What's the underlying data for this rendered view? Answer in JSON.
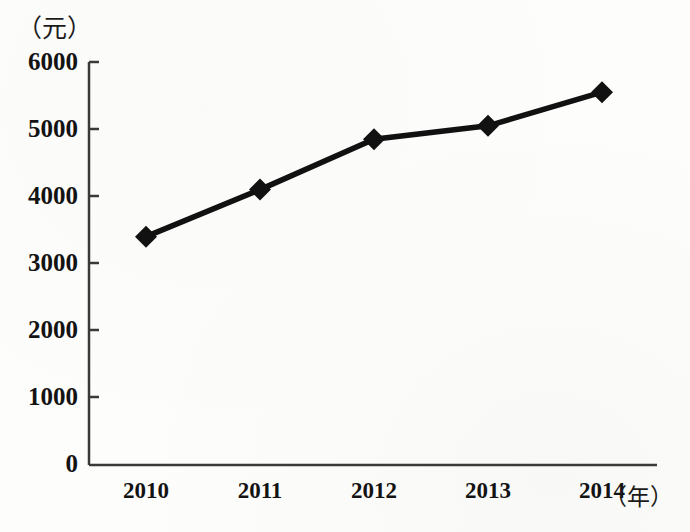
{
  "chart_data": {
    "type": "line",
    "title": "",
    "xlabel": "年",
    "ylabel": "元",
    "xlabel_display": "（年）",
    "ylabel_display": "（元）",
    "categories": [
      "2010",
      "2011",
      "2012",
      "2013",
      "2014"
    ],
    "values": [
      3400,
      4100,
      4850,
      5050,
      5550
    ],
    "series": [
      {
        "name": "",
        "values": [
          3400,
          4100,
          4850,
          5050,
          5550
        ]
      }
    ],
    "ylim": [
      0,
      6000
    ],
    "yticks": [
      0,
      1000,
      2000,
      3000,
      4000,
      5000,
      6000
    ],
    "ytick_labels": [
      "0",
      "1000",
      "2000",
      "3000",
      "4000",
      "5000",
      "6000"
    ],
    "xtick_labels": [
      "2010",
      "2011",
      "2012",
      "2013",
      "2014"
    ],
    "grid": false,
    "legend": false,
    "legend_position": "none",
    "marker": "diamond",
    "line_color": "#111111",
    "marker_color": "#111111",
    "background_color": "#fdfdfb",
    "axis_color": "#3a3a3a"
  }
}
